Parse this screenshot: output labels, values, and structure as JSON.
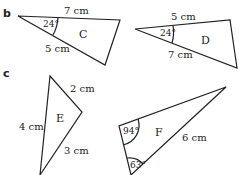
{
  "parts": {
    "b": "b",
    "c": "c"
  },
  "triangles": {
    "C": {
      "name": "C",
      "side_top": "7 cm",
      "side_bottom": "5 cm",
      "angle": "24°"
    },
    "D": {
      "name": "D",
      "side_top": "5 cm",
      "side_bottom": "7 cm",
      "angle": "24°"
    },
    "E": {
      "name": "E",
      "side_right_top": "2 cm",
      "side_left": "4 cm",
      "side_right_bottom": "3 cm"
    },
    "F": {
      "name": "F",
      "angle_top": "94°",
      "angle_bottom": "63°",
      "side_right": "6 cm"
    }
  }
}
